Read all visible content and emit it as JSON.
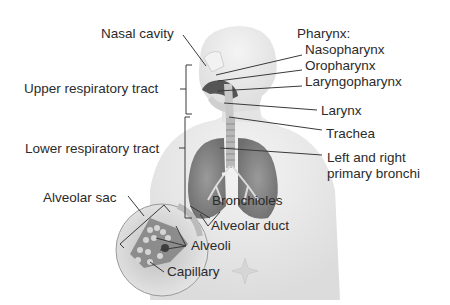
{
  "title_clipped": "",
  "labels": {
    "nasal_cavity": "Nasal cavity",
    "pharynx": "Pharynx:",
    "nasopharynx": "Nasopharynx",
    "oropharynx": "Oropharynx",
    "laryngopharynx": "Laryngopharynx",
    "upper_tract": "Upper respiratory tract",
    "larynx": "Larynx",
    "trachea": "Trachea",
    "lower_tract": "Lower respiratory tract",
    "bronchi_line1": "Left and right",
    "bronchi_line2": "primary bronchi",
    "alveolar_sac": "Alveolar sac",
    "bronchioles": "Bronchioles",
    "alveolar_duct": "Alveolar duct",
    "alveoli": "Alveoli",
    "capillary": "Capillary"
  },
  "colors": {
    "line": "#3a3a3a",
    "body_fill": "#ececec",
    "lung_fill": "#8a8a8a",
    "magnifier_fill": "#d8d8d8"
  }
}
